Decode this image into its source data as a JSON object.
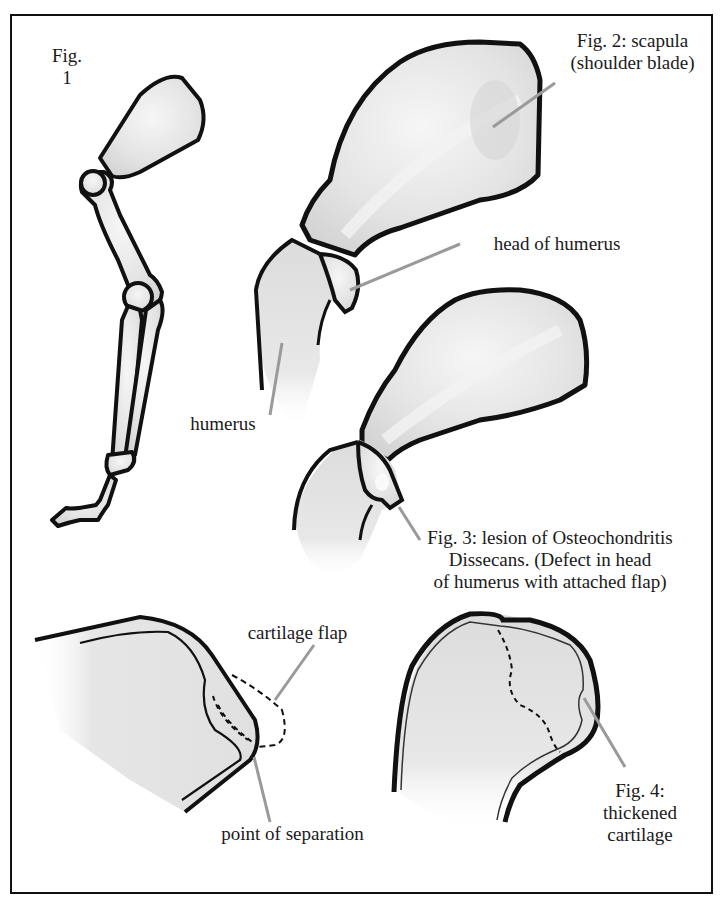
{
  "figure": {
    "fig1": {
      "label_line1": "Fig.",
      "label_line2": "1"
    },
    "fig2": {
      "label_line1": "Fig. 2: scapula",
      "label_line2": "(shoulder blade)"
    },
    "head_of_humerus": "head of humerus",
    "humerus": "humerus",
    "fig3": {
      "line1": "Fig. 3: lesion of Osteochondritis",
      "line2": "Dissecans. (Defect in head",
      "line3": "of humerus with attached flap)"
    },
    "cartilage_flap": "cartilage flap",
    "point_of_separation": "point of separation",
    "fig4": {
      "line1": "Fig. 4:",
      "line2": "thickened",
      "line3": "cartilage"
    }
  },
  "colors": {
    "outline": "#111111",
    "bone_fill": "#e6e6e6",
    "shade": "#c8c8c8",
    "leader": "#9a9a9a",
    "background": "#ffffff"
  }
}
